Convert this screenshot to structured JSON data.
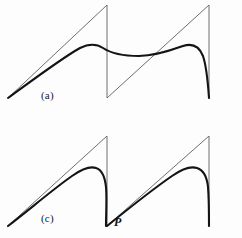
{
  "figure": {
    "background_color": "#fdfdfd",
    "sawtooth_color": "#5f5f5f",
    "curve_color": "#141414",
    "sawtooth_width": 0.9,
    "curve_width": 2.1,
    "panels": [
      {
        "id": "a",
        "label": "(a)",
        "label_x": 41,
        "label_y": 89,
        "sawtooth_path": "M 8,98 L 107,5 L 107,98 L 209,5 L 209,98",
        "curve_path": "M 8,98 C 30,82 62,58 80,48 C 90,43 97,44 103,48 C 112,54 124,56 139,56 C 156,56 172,50 183,46 C 192,43 199,46 203,56 C 207,68 208,84 209,98"
      },
      {
        "id": "c",
        "label": "(c)",
        "label_x": 41,
        "label_y": 93,
        "sawtooth_path": "M 8,107 L 107,17 L 107,107 L 209,17 L 209,107",
        "curve_path": "M 8,107 C 30,90 56,68 72,57 C 82,50 90,47 96,49 C 102,51 105,58 106,68 C 107,80 106,95 106,107 C 106,107 106,107 106,107 M 107,107 C 128,90 156,68 172,57 C 182,50 191,47 197,49 C 203,51 207,58 208,68 C 209,80 209,95 209,107"
      }
    ],
    "annotations": [
      {
        "id": "point-p",
        "text": "P",
        "x": 114,
        "y": 215
      }
    ]
  }
}
